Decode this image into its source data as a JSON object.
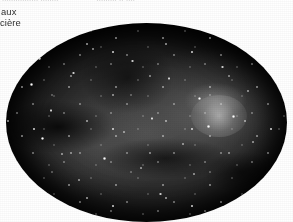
{
  "page": {
    "background_color": "#ffffff",
    "width": 293,
    "height": 222
  },
  "text": {
    "clipped_top_line": {
      "note": "top line of body text is cut off by the crop; only the bottom pixel row of the glyphs is visible",
      "left_fragment": "................ ........",
      "right_fragment": "......... .. ....",
      "color": "#8d8d8d"
    },
    "margin_fragments": [
      {
        "id": "fragment-aux",
        "value": "aux"
      },
      {
        "id": "fragment-ciere",
        "value": "cière"
      }
    ],
    "language": "fr",
    "text_color": "#2e2e2e"
  },
  "figure": {
    "name": "star-field-photograph",
    "shape": "ellipse",
    "caption": "",
    "palette": {
      "sky_dark": "#050505",
      "sky_mid": "#343434",
      "sky_light": "#4a4a4a",
      "star_color": "#ffffff",
      "rim": "#000000"
    },
    "bounds": {
      "left": 6,
      "top": 23,
      "width": 281,
      "height": 199
    },
    "bright_knot": {
      "x_pct": 74,
      "y_pct": 44,
      "label": "star cluster"
    },
    "dust_lanes": [
      {
        "x_pct": 22,
        "y_pct": 52
      },
      {
        "x_pct": 56,
        "y_pct": 66
      },
      {
        "x_pct": 44,
        "y_pct": 30
      },
      {
        "x_pct": 80,
        "y_pct": 72
      }
    ],
    "prominent_stars": [
      {
        "x_pct": 12,
        "y_pct": 18,
        "size": 3.0
      },
      {
        "x_pct": 9,
        "y_pct": 31,
        "size": 2.6
      },
      {
        "x_pct": 16,
        "y_pct": 44,
        "size": 2.4
      },
      {
        "x_pct": 13,
        "y_pct": 58,
        "size": 2.8
      },
      {
        "x_pct": 24,
        "y_pct": 25,
        "size": 2.2
      },
      {
        "x_pct": 31,
        "y_pct": 13,
        "size": 2.5
      },
      {
        "x_pct": 38,
        "y_pct": 36,
        "size": 2.1
      },
      {
        "x_pct": 45,
        "y_pct": 19,
        "size": 2.4
      },
      {
        "x_pct": 52,
        "y_pct": 48,
        "size": 2.3
      },
      {
        "x_pct": 58,
        "y_pct": 28,
        "size": 2.6
      },
      {
        "x_pct": 63,
        "y_pct": 61,
        "size": 2.2
      },
      {
        "x_pct": 69,
        "y_pct": 38,
        "size": 3.1
      },
      {
        "x_pct": 72,
        "y_pct": 52,
        "size": 2.5
      },
      {
        "x_pct": 77,
        "y_pct": 22,
        "size": 2.3
      },
      {
        "x_pct": 81,
        "y_pct": 47,
        "size": 2.7
      },
      {
        "x_pct": 86,
        "y_pct": 34,
        "size": 2.2
      },
      {
        "x_pct": 88,
        "y_pct": 60,
        "size": 2.0
      },
      {
        "x_pct": 67,
        "y_pct": 76,
        "size": 2.4
      },
      {
        "x_pct": 48,
        "y_pct": 73,
        "size": 2.2
      },
      {
        "x_pct": 35,
        "y_pct": 68,
        "size": 2.5
      },
      {
        "x_pct": 26,
        "y_pct": 79,
        "size": 2.1
      },
      {
        "x_pct": 55,
        "y_pct": 86,
        "size": 2.3
      },
      {
        "x_pct": 42,
        "y_pct": 55,
        "size": 2.0
      },
      {
        "x_pct": 20,
        "y_pct": 66,
        "size": 2.2
      }
    ]
  }
}
